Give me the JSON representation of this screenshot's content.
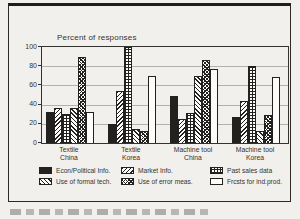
{
  "colors": {
    "ink": "#22211f",
    "background": "#f2f0ec",
    "gridline": "#b3b1ac",
    "bar_white": "#fcfcfa"
  },
  "chart_data": {
    "type": "bar",
    "title": "Percent of responses",
    "categories": [
      [
        "Textile",
        "China"
      ],
      [
        "Textile",
        "Korea"
      ],
      [
        "Machine tool",
        "China"
      ],
      [
        "Machine tool",
        "Korea"
      ]
    ],
    "series": [
      {
        "name": "Econ/Political Info.",
        "pattern": "solid-black",
        "values": [
          32,
          20,
          49,
          27
        ]
      },
      {
        "name": "Market Info.",
        "pattern": "diagonal-forward",
        "values": [
          36,
          54,
          25,
          44
        ]
      },
      {
        "name": "Past sales data",
        "pattern": "grid",
        "values": [
          30,
          100,
          31,
          80
        ]
      },
      {
        "name": "Use of formal tech.",
        "pattern": "diagonal-back",
        "values": [
          36,
          15,
          70,
          13
        ]
      },
      {
        "name": "Use of error meas.",
        "pattern": "checker",
        "values": [
          90,
          13,
          86,
          29
        ]
      },
      {
        "name": "Frcsts for ind.prod.",
        "pattern": "white",
        "values": [
          32,
          70,
          77,
          69
        ]
      }
    ],
    "ylim": [
      0,
      100
    ],
    "yticks": [
      0,
      20,
      40,
      60,
      80,
      100
    ],
    "grid": true,
    "legend_position": "bottom",
    "legend_rows": [
      [
        "Econ/Political Info.",
        "Market Info.",
        "Past sales data"
      ],
      [
        "Use of formal tech.",
        "Use of error meas.",
        "Frcsts for ind.prod."
      ]
    ]
  }
}
